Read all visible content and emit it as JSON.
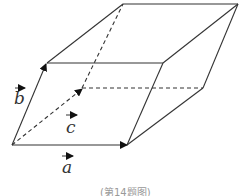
{
  "diagram": {
    "type": "parallelepiped",
    "vectors": [
      {
        "name": "a",
        "label": "a"
      },
      {
        "name": "b",
        "label": "b"
      },
      {
        "name": "c",
        "label": "c"
      }
    ],
    "caption": "(第14题图)"
  }
}
